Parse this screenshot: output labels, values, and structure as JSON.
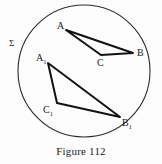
{
  "figure": {
    "caption": "Figure 112",
    "plane_label": "Σ",
    "background_color": "#fdfdfd",
    "ink_color": "#1a1a1a"
  },
  "diagram_data": {
    "type": "geometry-diagram",
    "description": "Two triangles inscribed in a circle representing a plane sigma",
    "boundary": {
      "name": "plane-circle",
      "shape": "circle",
      "center": [
        84,
        71
      ],
      "radius": 66,
      "stroke": "#2b2b2b",
      "stroke_width": 1.1,
      "fill": "none"
    },
    "shapes": [
      {
        "name": "triangle-abc",
        "type": "triangle",
        "stroke": "#111111",
        "stroke_width": 2.0,
        "vertices": [
          {
            "label": "A",
            "x": 66,
            "y": 30,
            "label_x": 57,
            "label_y": 21
          },
          {
            "label": "B",
            "x": 133,
            "y": 53,
            "label_x": 137,
            "label_y": 48
          },
          {
            "label": "C",
            "x": 101,
            "y": 55,
            "label_x": 97,
            "label_y": 58
          }
        ]
      },
      {
        "name": "triangle-a1b1c1",
        "type": "triangle",
        "stroke": "#111111",
        "stroke_width": 2.0,
        "vertices": [
          {
            "label": "A",
            "sub": "1",
            "x": 48,
            "y": 63,
            "label_x": 36,
            "label_y": 53
          },
          {
            "label": "B",
            "sub": "1",
            "x": 120,
            "y": 117,
            "label_x": 122,
            "label_y": 118
          },
          {
            "label": "C",
            "sub": "1",
            "x": 57,
            "y": 103,
            "label_x": 43,
            "label_y": 105
          }
        ]
      }
    ],
    "labels": {
      "plane": {
        "text": "Σ",
        "x": 9,
        "y": 39
      },
      "a": "A",
      "b": "B",
      "c": "C",
      "a1_base": "A",
      "a1_sub": "1",
      "b1_base": "B",
      "b1_sub": "1",
      "c1_base": "C",
      "c1_sub": "1"
    }
  }
}
